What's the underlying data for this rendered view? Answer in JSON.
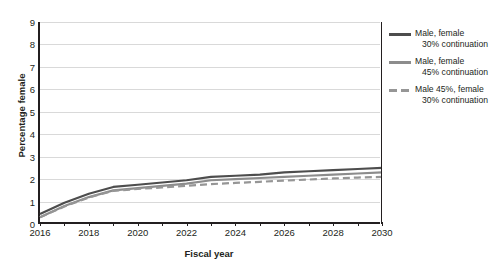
{
  "chart_data": {
    "type": "line",
    "title": "",
    "xlabel": "Fiscal year",
    "ylabel": "Percentage female",
    "xlim": [
      2016,
      2030
    ],
    "ylim": [
      0,
      9
    ],
    "ytick_step": 1,
    "xtick_step": 1,
    "xtick_label_step": 2,
    "grid": "horizontal",
    "legend_position": "right",
    "yticks": [
      "0",
      "1",
      "2",
      "3",
      "4",
      "5",
      "6",
      "7",
      "8",
      "9"
    ],
    "xticks": [
      "2016",
      "2018",
      "2020",
      "2022",
      "2024",
      "2026",
      "2028",
      "2030"
    ],
    "x": [
      2016,
      2017,
      2018,
      2019,
      2020,
      2021,
      2022,
      2023,
      2024,
      2025,
      2026,
      2027,
      2028,
      2029,
      2030
    ],
    "series": [
      {
        "name": "Male, female 30% continuation",
        "name_line1": "Male, female",
        "name_line2": "30% continuation",
        "color": "#4d4d4d",
        "style": "solid",
        "width": 2.2,
        "values": [
          0.45,
          0.95,
          1.35,
          1.65,
          1.75,
          1.85,
          1.95,
          2.1,
          2.15,
          2.2,
          2.3,
          2.35,
          2.4,
          2.45,
          2.5
        ]
      },
      {
        "name": "Male, female 45% continuation",
        "name_line1": "Male, female",
        "name_line2": "45% continuation",
        "color": "#8c8c8c",
        "style": "solid",
        "width": 2.2,
        "values": [
          0.3,
          0.8,
          1.2,
          1.5,
          1.6,
          1.7,
          1.8,
          1.95,
          2.0,
          2.05,
          2.1,
          2.15,
          2.2,
          2.25,
          2.3
        ]
      },
      {
        "name": "Male 45%, female 30% continuation",
        "name_line1": "Male 45%, female",
        "name_line2": "30% continuation",
        "color": "#969696",
        "style": "dashed",
        "width": 2.2,
        "values": [
          0.3,
          0.78,
          1.18,
          1.48,
          1.56,
          1.63,
          1.7,
          1.78,
          1.83,
          1.88,
          1.93,
          1.98,
          2.03,
          2.07,
          2.1
        ]
      }
    ]
  }
}
